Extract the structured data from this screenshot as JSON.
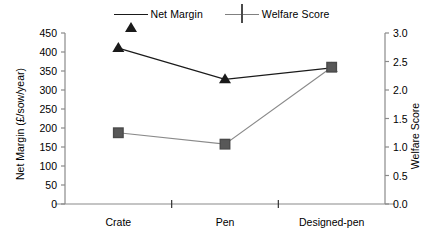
{
  "chart_data": {
    "type": "line",
    "title": "",
    "categories": [
      "Crate",
      "Pen",
      "Designed-pen"
    ],
    "series": [
      {
        "name": "Net Margin",
        "axis": "left",
        "marker": "triangle",
        "color": "#1a1a1a",
        "values": [
          410,
          328,
          358
        ]
      },
      {
        "name": "Welfare Score",
        "axis": "right",
        "marker": "square",
        "color": "#585858",
        "values": [
          1.25,
          1.05,
          2.4
        ]
      }
    ],
    "xlabel": "",
    "ylabel": "Net Margin (£/sow/year)",
    "y2label": "Welfare Score",
    "ylim": [
      0,
      450
    ],
    "y2lim": [
      0,
      3.0
    ],
    "yticks": [
      0,
      50,
      100,
      150,
      200,
      250,
      300,
      350,
      400,
      450
    ],
    "y2ticks": [
      0.0,
      0.5,
      1.0,
      1.5,
      2.0,
      2.5,
      3.0
    ],
    "ytick_labels": [
      "0",
      "50",
      "100",
      "150",
      "200",
      "250",
      "300",
      "350",
      "400",
      "450"
    ],
    "y2tick_labels": [
      "0.0",
      "0.5",
      "1.0",
      "1.5",
      "2.0",
      "2.5",
      "3.0"
    ],
    "grid": false,
    "legend_position": "top-center",
    "legend_entries": [
      "Net Margin",
      "Welfare Score"
    ]
  },
  "legend": {
    "items": [
      {
        "label": "Net Margin",
        "marker": "triangle-marker-icon"
      },
      {
        "label": "Welfare Score",
        "marker": "square-marker-icon"
      }
    ]
  },
  "axes": {
    "left_title": "Net Margin (£/sow/year)",
    "right_title": "Welfare Score"
  }
}
